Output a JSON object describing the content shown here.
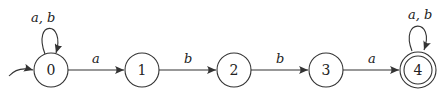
{
  "diagram": {
    "type": "finite-automaton",
    "states": [
      {
        "id": "0",
        "label": "0",
        "initial": true,
        "accepting": false,
        "cx": 51,
        "cy": 70
      },
      {
        "id": "1",
        "label": "1",
        "initial": false,
        "accepting": false,
        "cx": 142,
        "cy": 70
      },
      {
        "id": "2",
        "label": "2",
        "initial": false,
        "accepting": false,
        "cx": 234,
        "cy": 70
      },
      {
        "id": "3",
        "label": "3",
        "initial": false,
        "accepting": false,
        "cx": 326,
        "cy": 70
      },
      {
        "id": "4",
        "label": "4",
        "initial": false,
        "accepting": true,
        "cx": 418,
        "cy": 70
      }
    ],
    "transitions": [
      {
        "from": "0",
        "to": "0",
        "label": "a, b"
      },
      {
        "from": "0",
        "to": "1",
        "label": "a"
      },
      {
        "from": "1",
        "to": "2",
        "label": "b"
      },
      {
        "from": "2",
        "to": "3",
        "label": "b"
      },
      {
        "from": "3",
        "to": "4",
        "label": "a"
      },
      {
        "from": "4",
        "to": "4",
        "label": "a, b"
      }
    ],
    "colors": {
      "stroke": "#333333",
      "background": "#ffffff"
    }
  }
}
